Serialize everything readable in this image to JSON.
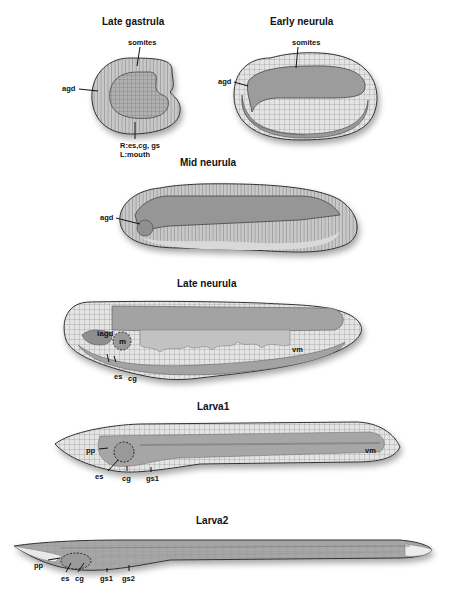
{
  "panels": {
    "late_gastrula": {
      "title": "Late gastrula",
      "labels": {
        "somites": "somites",
        "agd": "agd",
        "bottom_line1": "R:es,cg, gs",
        "bottom_line2": "L:mouth"
      }
    },
    "early_neurula": {
      "title": "Early neurula",
      "labels": {
        "somites": "somites",
        "agd": "agd"
      }
    },
    "mid_neurula": {
      "title": "Mid neurula",
      "labels": {
        "agd": "agd"
      }
    },
    "late_neurula": {
      "title": "Late neurula",
      "labels": {
        "lagd": "lagd",
        "m": "m",
        "vm": "vm",
        "es": "es",
        "cg": "cg"
      }
    },
    "larva1": {
      "title": "Larva1",
      "labels": {
        "pp": "pp",
        "es": "es",
        "cg": "cg",
        "gs1": "gs1",
        "vm": "vm"
      }
    },
    "larva2": {
      "title": "Larva2",
      "labels": {
        "pp": "pp",
        "es": "es",
        "cg": "cg",
        "gs1": "gs1",
        "gs2": "gs2"
      }
    }
  },
  "colors": {
    "tissue_fill": "#a9a9a9",
    "tissue_light": "#d4d4d4",
    "outline": "#3a3a3a",
    "background": "#ffffff"
  }
}
